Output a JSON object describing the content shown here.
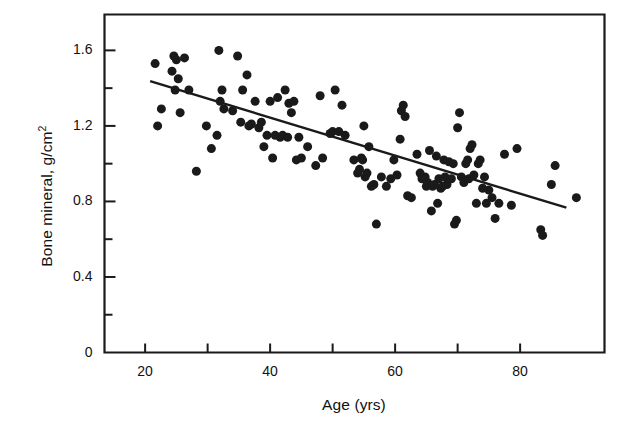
{
  "chart_data": {
    "type": "scatter",
    "title": "",
    "xlabel": "Age (yrs)",
    "ylabel": "Bone mineral, g/cm2",
    "ylabel_base": "Bone mineral, g/cm",
    "ylabel_exponent": "2",
    "xlim": [
      13.5,
      93.5
    ],
    "ylim": [
      0,
      1.79
    ],
    "grid": false,
    "legend": null,
    "marker": {
      "shape": "circle",
      "color": "#1a1a1a",
      "size_px": 9
    },
    "x_major_ticks": [
      20,
      40,
      60,
      80
    ],
    "x_minor_ticks": [
      30,
      50,
      70
    ],
    "x_tick_labels": [
      "20",
      "40",
      "60",
      "80"
    ],
    "y_major_ticks": [
      0,
      0.4,
      0.8,
      1.2,
      1.6
    ],
    "y_minor_ticks": [
      0.2,
      0.6,
      1.0,
      1.4
    ],
    "y_tick_labels": [
      "0",
      "0.4",
      "0.8",
      "1.2",
      "1.6"
    ],
    "fit_line": {
      "type": "linear-regression",
      "color": "#1a1a1a",
      "x_start": 20.8,
      "y_start": 1.437,
      "x_end": 87.4,
      "y_end": 0.767,
      "slope": -0.01006,
      "intercept": 1.646
    },
    "n_points": 124,
    "points": [
      [
        21.6,
        1.53
      ],
      [
        22.0,
        1.2
      ],
      [
        22.6,
        1.29
      ],
      [
        24.3,
        1.49
      ],
      [
        24.6,
        1.57
      ],
      [
        24.8,
        1.39
      ],
      [
        25.0,
        1.55
      ],
      [
        25.3,
        1.45
      ],
      [
        25.6,
        1.27
      ],
      [
        26.3,
        1.56
      ],
      [
        27.0,
        1.39
      ],
      [
        28.2,
        0.96
      ],
      [
        29.8,
        1.2
      ],
      [
        30.6,
        1.08
      ],
      [
        31.5,
        1.15
      ],
      [
        31.8,
        1.6
      ],
      [
        32.0,
        1.33
      ],
      [
        32.3,
        1.39
      ],
      [
        32.6,
        1.29
      ],
      [
        34.0,
        1.28
      ],
      [
        34.8,
        1.57
      ],
      [
        35.3,
        1.22
      ],
      [
        35.6,
        1.39
      ],
      [
        36.3,
        1.47
      ],
      [
        36.6,
        1.2
      ],
      [
        37.0,
        1.21
      ],
      [
        37.6,
        1.33
      ],
      [
        38.2,
        1.19
      ],
      [
        38.6,
        1.22
      ],
      [
        39.0,
        1.09
      ],
      [
        39.5,
        1.15
      ],
      [
        40.0,
        1.33
      ],
      [
        40.4,
        1.03
      ],
      [
        40.8,
        1.15
      ],
      [
        41.2,
        1.35
      ],
      [
        41.6,
        1.14
      ],
      [
        42.0,
        1.15
      ],
      [
        42.4,
        1.39
      ],
      [
        42.8,
        1.14
      ],
      [
        43.0,
        1.32
      ],
      [
        43.4,
        1.27
      ],
      [
        43.8,
        1.33
      ],
      [
        44.2,
        1.02
      ],
      [
        44.6,
        1.14
      ],
      [
        45.0,
        1.03
      ],
      [
        46.0,
        1.09
      ],
      [
        47.3,
        0.99
      ],
      [
        48.0,
        1.36
      ],
      [
        48.4,
        1.03
      ],
      [
        49.6,
        1.16
      ],
      [
        50.0,
        1.17
      ],
      [
        50.4,
        1.39
      ],
      [
        51.0,
        1.17
      ],
      [
        51.5,
        1.31
      ],
      [
        52.0,
        1.15
      ],
      [
        53.4,
        1.02
      ],
      [
        54.0,
        0.95
      ],
      [
        54.3,
        0.97
      ],
      [
        54.6,
        1.03
      ],
      [
        54.8,
        1.02
      ],
      [
        55.0,
        1.2
      ],
      [
        55.2,
        0.93
      ],
      [
        55.5,
        0.95
      ],
      [
        55.8,
        1.09
      ],
      [
        56.2,
        0.88
      ],
      [
        56.6,
        0.89
      ],
      [
        57.0,
        0.68
      ],
      [
        57.8,
        0.93
      ],
      [
        58.6,
        0.88
      ],
      [
        59.3,
        0.92
      ],
      [
        59.8,
        1.02
      ],
      [
        60.3,
        0.94
      ],
      [
        60.8,
        1.13
      ],
      [
        61.0,
        1.28
      ],
      [
        61.3,
        1.31
      ],
      [
        61.6,
        1.25
      ],
      [
        62.0,
        0.83
      ],
      [
        62.6,
        0.82
      ],
      [
        63.5,
        1.05
      ],
      [
        64.0,
        0.95
      ],
      [
        64.3,
        0.92
      ],
      [
        64.8,
        0.93
      ],
      [
        65.0,
        0.88
      ],
      [
        65.2,
        0.9
      ],
      [
        65.5,
        1.07
      ],
      [
        65.8,
        0.75
      ],
      [
        66.0,
        0.88
      ],
      [
        66.3,
        0.89
      ],
      [
        66.6,
        1.04
      ],
      [
        66.8,
        0.79
      ],
      [
        67.0,
        0.92
      ],
      [
        67.3,
        0.87
      ],
      [
        67.6,
        0.88
      ],
      [
        67.8,
        1.02
      ],
      [
        68.0,
        0.93
      ],
      [
        68.3,
        0.89
      ],
      [
        68.6,
        1.01
      ],
      [
        69.0,
        0.92
      ],
      [
        69.3,
        1.0
      ],
      [
        69.5,
        0.68
      ],
      [
        69.8,
        0.7
      ],
      [
        70.0,
        1.19
      ],
      [
        70.3,
        1.27
      ],
      [
        70.6,
        0.93
      ],
      [
        71.0,
        0.9
      ],
      [
        71.3,
        1.0
      ],
      [
        71.6,
        1.02
      ],
      [
        71.8,
        0.92
      ],
      [
        72.0,
        1.08
      ],
      [
        72.3,
        1.1
      ],
      [
        72.6,
        0.94
      ],
      [
        73.0,
        0.79
      ],
      [
        73.3,
        1.0
      ],
      [
        73.6,
        1.02
      ],
      [
        74.0,
        0.87
      ],
      [
        74.3,
        0.93
      ],
      [
        74.6,
        0.79
      ],
      [
        75.0,
        0.86
      ],
      [
        75.5,
        0.82
      ],
      [
        76.0,
        0.71
      ],
      [
        76.6,
        0.79
      ],
      [
        77.5,
        1.05
      ],
      [
        78.6,
        0.78
      ],
      [
        79.5,
        1.08
      ],
      [
        83.3,
        0.65
      ],
      [
        83.6,
        0.62
      ],
      [
        85.0,
        0.89
      ],
      [
        85.6,
        0.99
      ],
      [
        89.0,
        0.82
      ]
    ]
  },
  "axes": {
    "frame_color": "#1a1a1a",
    "background": "#ffffff"
  }
}
